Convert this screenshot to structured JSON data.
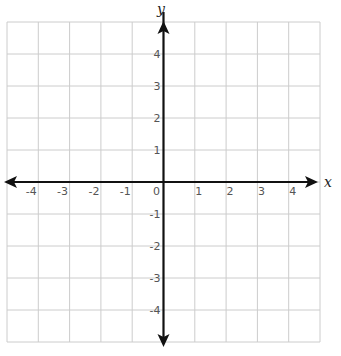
{
  "chart_data": {
    "type": "scatter",
    "title": "",
    "xlabel": "x",
    "ylabel": "y",
    "xlim": [
      -5,
      5
    ],
    "ylim": [
      -5,
      5
    ],
    "grid": true,
    "x_ticks": [
      -4,
      -3,
      -2,
      -1,
      0,
      1,
      2,
      3,
      4
    ],
    "y_ticks": [
      4,
      3,
      2,
      1,
      -1,
      -2,
      -3,
      -4
    ],
    "x_tick_labels": [
      "-4",
      "-3",
      "-2",
      "-1",
      "0",
      "1",
      "2",
      "3",
      "4"
    ],
    "y_tick_labels": [
      "4",
      "3",
      "2",
      "1",
      "-1",
      "-2",
      "-3",
      "-4"
    ],
    "series": [],
    "legend": null
  },
  "labels": {
    "x_axis": "x",
    "y_axis": "y",
    "origin": "0"
  },
  "colors": {
    "grid": "#cccccc",
    "axis": "#111111",
    "tick_text": "#555555"
  }
}
